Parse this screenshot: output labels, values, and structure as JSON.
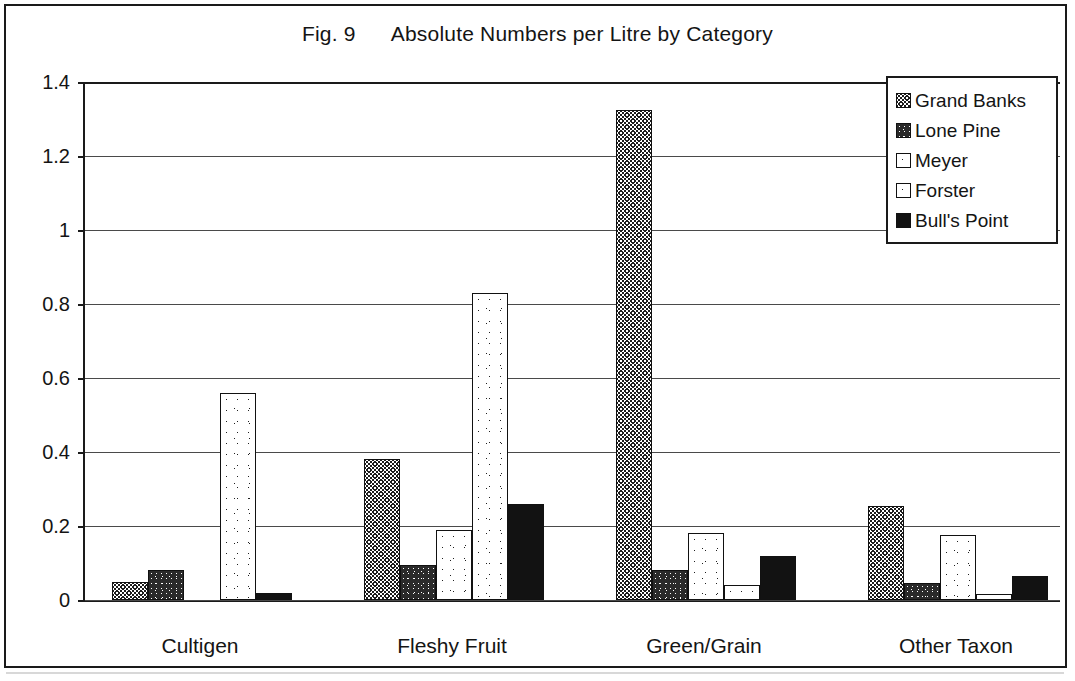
{
  "chart_data": {
    "type": "bar",
    "title": "Fig. 9      Absolute Numbers per Litre by Category",
    "title_figure_number": "Fig. 9",
    "title_text": "Absolute Numbers per Litre by Category",
    "xlabel": "",
    "ylabel": "",
    "ylim": [
      0,
      1.4
    ],
    "ytick_labels": [
      "1.4",
      "1.2",
      "1",
      "0.8",
      "0.6",
      "0.4",
      "0.2",
      "0"
    ],
    "ytick_values": [
      1.4,
      1.2,
      1.0,
      0.8,
      0.6,
      0.4,
      0.2,
      0
    ],
    "grid": true,
    "grid_axis": "y",
    "legend_position": "top-right",
    "categories": [
      "Cultigen",
      "Fleshy Fruit",
      "Green/Grain",
      "Other Taxon"
    ],
    "series": [
      {
        "name": "Grand Banks",
        "fill": "fill-grand-banks",
        "values": [
          0.05,
          0.38,
          1.325,
          0.255
        ]
      },
      {
        "name": "Lone Pine",
        "fill": "fill-lone-pine",
        "values": [
          0.08,
          0.095,
          0.08,
          0.045
        ]
      },
      {
        "name": "Meyer",
        "fill": "fill-meyer",
        "values": [
          0,
          0.19,
          0.18,
          0.175
        ]
      },
      {
        "name": "Forster",
        "fill": "fill-forster",
        "values": [
          0.56,
          0.83,
          0.04,
          0.015
        ]
      },
      {
        "name": "Bull's Point",
        "fill": "fill-bulls-point",
        "values": [
          0.02,
          0.26,
          0.12,
          0.065
        ]
      }
    ]
  },
  "legend": {
    "items": [
      {
        "label": "Grand Banks",
        "swatch": "fill-grand-banks"
      },
      {
        "label": "Lone Pine",
        "swatch": "fill-lone-pine"
      },
      {
        "label": "Meyer",
        "swatch": "fill-meyer"
      },
      {
        "label": "Forster",
        "swatch": "fill-forster"
      },
      {
        "label": "Bull's Point",
        "swatch": "fill-bulls-point"
      }
    ]
  },
  "colors": {
    "ink": "#141414",
    "grid": "#4a4a4a",
    "axis": "#1a1a1a",
    "page": "#ffffff"
  },
  "geometry": {
    "plot_left": 83,
    "plot_top": 82,
    "plot_width": 975,
    "plot_height": 518,
    "group_starts": [
      110,
      362,
      614,
      866
    ],
    "bar_width": 36,
    "bar_gap": 0
  }
}
